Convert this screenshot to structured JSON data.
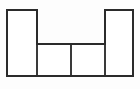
{
  "figure": {
    "caption": "",
    "canvas": {
      "width": 140,
      "height": 89,
      "background_color": "#fdfdfd"
    },
    "style": {
      "stroke_color": "#2b2b2b",
      "divider_color": "#3a3a3a",
      "fill_color": "#ffffff",
      "stroke_width": 2
    },
    "outline": {
      "name": "h-shape-outline",
      "points": "7,10 37,10 37,44 105,44 105,10 133,10 133,76 7,76",
      "closed": true
    },
    "cells": [
      {
        "name": "left-tall-rectangle",
        "label": "",
        "x": 7,
        "y": 10,
        "width": 30,
        "height": 66
      },
      {
        "name": "middle-left-rectangle",
        "label": "",
        "x": 37,
        "y": 44,
        "width": 34,
        "height": 32
      },
      {
        "name": "middle-right-rectangle",
        "label": "",
        "x": 71,
        "y": 44,
        "width": 34,
        "height": 32
      },
      {
        "name": "right-tall-rectangle",
        "label": "",
        "x": 105,
        "y": 10,
        "width": 28,
        "height": 66
      }
    ],
    "dividers": [
      {
        "name": "vertical-divider",
        "x1": 71,
        "y1": 44,
        "x2": 71,
        "y2": 76
      },
      {
        "name": "left-inner-vertical-edge",
        "x1": 37,
        "y1": 44,
        "x2": 37,
        "y2": 76
      },
      {
        "name": "right-inner-vertical-edge",
        "x1": 105,
        "y1": 44,
        "x2": 105,
        "y2": 76
      }
    ]
  }
}
